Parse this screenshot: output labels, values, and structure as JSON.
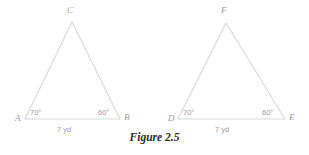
{
  "figure": {
    "caption": "Figure 2.5",
    "caption_left": 0,
    "caption_top": 132,
    "stroke_color": "#d8d8da",
    "label_color": "#9a9a9c",
    "background": "#ffffff"
  },
  "triangles": [
    {
      "id": "triangle-abc",
      "vertices": {
        "left": {
          "name": "A",
          "x": 25,
          "y": 119,
          "label_x": 15,
          "label_y": 114
        },
        "right": {
          "name": "B",
          "x": 120,
          "y": 119,
          "label_x": 124,
          "label_y": 113
        },
        "apex": {
          "name": "C",
          "x": 72,
          "y": 22,
          "label_x": 67,
          "label_y": 6
        }
      },
      "angles": [
        {
          "at": "A",
          "text": "70°",
          "label_x": 30,
          "label_y": 109
        },
        {
          "at": "B",
          "text": "60°",
          "label_x": 98,
          "label_y": 109
        }
      ],
      "side": {
        "text": "7 yd",
        "label_x": 57,
        "label_y": 126
      }
    },
    {
      "id": "triangle-def",
      "vertices": {
        "left": {
          "name": "D",
          "x": 178,
          "y": 119,
          "label_x": 168,
          "label_y": 114
        },
        "right": {
          "name": "E",
          "x": 285,
          "y": 119,
          "label_x": 289,
          "label_y": 113
        },
        "apex": {
          "name": "F",
          "x": 226,
          "y": 23,
          "label_x": 221,
          "label_y": 6
        }
      },
      "angles": [
        {
          "at": "D",
          "text": "70°",
          "label_x": 183,
          "label_y": 109
        },
        {
          "at": "E",
          "text": "60°",
          "label_x": 262,
          "label_y": 109
        }
      ],
      "side": {
        "text": "7 yd",
        "label_x": 215,
        "label_y": 126
      }
    }
  ]
}
